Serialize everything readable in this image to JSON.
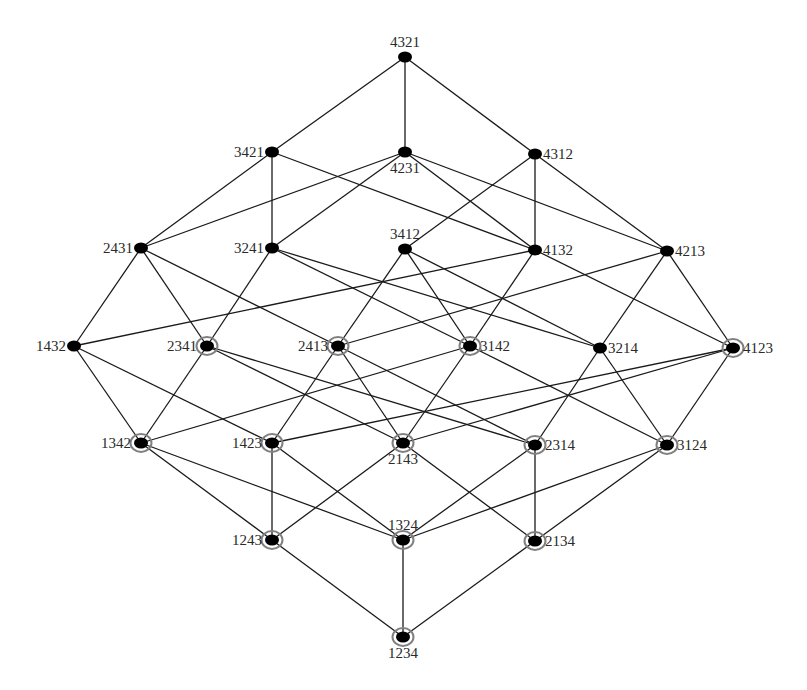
{
  "diagram": {
    "type": "hasse-lattice",
    "colors": {
      "edge": "#1a1a1a",
      "node": "#000000",
      "ring": "#808080",
      "label": "#2a2a2a",
      "background": "#ffffff"
    },
    "nodes": [
      {
        "id": "4321",
        "label": "4321",
        "x": 405,
        "y": 57,
        "ring": false,
        "label_pos": "top"
      },
      {
        "id": "3421",
        "label": "3421",
        "x": 272,
        "y": 152,
        "ring": false,
        "label_pos": "left"
      },
      {
        "id": "4231",
        "label": "4231",
        "x": 405,
        "y": 152,
        "ring": false,
        "label_pos": "bottom"
      },
      {
        "id": "4312",
        "label": "4312",
        "x": 535,
        "y": 154,
        "ring": false,
        "label_pos": "right"
      },
      {
        "id": "2431",
        "label": "2431",
        "x": 141,
        "y": 248,
        "ring": false,
        "label_pos": "left"
      },
      {
        "id": "3241",
        "label": "3241",
        "x": 272,
        "y": 248,
        "ring": false,
        "label_pos": "left"
      },
      {
        "id": "3412",
        "label": "3412",
        "x": 405,
        "y": 249,
        "ring": false,
        "label_pos": "top"
      },
      {
        "id": "4132",
        "label": "4132",
        "x": 535,
        "y": 250,
        "ring": false,
        "label_pos": "right"
      },
      {
        "id": "4213",
        "label": "4213",
        "x": 667,
        "y": 251,
        "ring": false,
        "label_pos": "right"
      },
      {
        "id": "1432",
        "label": "1432",
        "x": 74,
        "y": 346,
        "ring": false,
        "label_pos": "left"
      },
      {
        "id": "2341",
        "label": "2341",
        "x": 207,
        "y": 346,
        "ring": true,
        "label_pos": "left"
      },
      {
        "id": "2413",
        "label": "2413",
        "x": 338,
        "y": 346,
        "ring": true,
        "label_pos": "left"
      },
      {
        "id": "3142",
        "label": "3142",
        "x": 470,
        "y": 346,
        "ring": true,
        "label_pos": "right"
      },
      {
        "id": "3214",
        "label": "3214",
        "x": 600,
        "y": 348,
        "ring": false,
        "label_pos": "right"
      },
      {
        "id": "4123",
        "label": "4123",
        "x": 733,
        "y": 348,
        "ring": true,
        "label_pos": "right"
      },
      {
        "id": "1342",
        "label": "1342",
        "x": 141,
        "y": 443,
        "ring": true,
        "label_pos": "left"
      },
      {
        "id": "1423",
        "label": "1423",
        "x": 272,
        "y": 443,
        "ring": true,
        "label_pos": "left"
      },
      {
        "id": "2143",
        "label": "2143",
        "x": 403,
        "y": 443,
        "ring": true,
        "label_pos": "bottom"
      },
      {
        "id": "2314",
        "label": "2314",
        "x": 535,
        "y": 445,
        "ring": true,
        "label_pos": "right"
      },
      {
        "id": "3124",
        "label": "3124",
        "x": 667,
        "y": 445,
        "ring": true,
        "label_pos": "right"
      },
      {
        "id": "1243",
        "label": "1243",
        "x": 272,
        "y": 540,
        "ring": true,
        "label_pos": "left"
      },
      {
        "id": "1324",
        "label": "1324",
        "x": 403,
        "y": 540,
        "ring": true,
        "label_pos": "top"
      },
      {
        "id": "2134",
        "label": "2134",
        "x": 535,
        "y": 541,
        "ring": true,
        "label_pos": "right"
      },
      {
        "id": "1234",
        "label": "1234",
        "x": 403,
        "y": 637,
        "ring": true,
        "label_pos": "bottom"
      }
    ],
    "edges": [
      [
        "4321",
        "3421"
      ],
      [
        "4321",
        "4231"
      ],
      [
        "4321",
        "4312"
      ],
      [
        "3421",
        "2431"
      ],
      [
        "3421",
        "3241"
      ],
      [
        "3421",
        "4132"
      ],
      [
        "4231",
        "2431"
      ],
      [
        "4231",
        "3241"
      ],
      [
        "4231",
        "4132"
      ],
      [
        "4231",
        "4213"
      ],
      [
        "4312",
        "3412"
      ],
      [
        "4312",
        "4132"
      ],
      [
        "4312",
        "4213"
      ],
      [
        "2431",
        "1432"
      ],
      [
        "2431",
        "2341"
      ],
      [
        "2431",
        "2413"
      ],
      [
        "3241",
        "2341"
      ],
      [
        "3241",
        "3142"
      ],
      [
        "3241",
        "3214"
      ],
      [
        "3412",
        "2413"
      ],
      [
        "3412",
        "3142"
      ],
      [
        "3412",
        "3214"
      ],
      [
        "4132",
        "1432"
      ],
      [
        "4132",
        "3142"
      ],
      [
        "4132",
        "4123"
      ],
      [
        "4213",
        "2413"
      ],
      [
        "4213",
        "3214"
      ],
      [
        "4213",
        "4123"
      ],
      [
        "1432",
        "1342"
      ],
      [
        "1432",
        "1423"
      ],
      [
        "2341",
        "1342"
      ],
      [
        "2341",
        "2314"
      ],
      [
        "2341",
        "2143"
      ],
      [
        "2413",
        "1423"
      ],
      [
        "2413",
        "2143"
      ],
      [
        "2413",
        "2314"
      ],
      [
        "3142",
        "1342"
      ],
      [
        "3142",
        "2143"
      ],
      [
        "3142",
        "3124"
      ],
      [
        "3214",
        "2314"
      ],
      [
        "3214",
        "3124"
      ],
      [
        "4123",
        "1423"
      ],
      [
        "4123",
        "2143"
      ],
      [
        "4123",
        "3124"
      ],
      [
        "1342",
        "1243"
      ],
      [
        "1342",
        "1324"
      ],
      [
        "1423",
        "1243"
      ],
      [
        "1423",
        "1324"
      ],
      [
        "2143",
        "1243"
      ],
      [
        "2143",
        "2134"
      ],
      [
        "2314",
        "1324"
      ],
      [
        "2314",
        "2134"
      ],
      [
        "3124",
        "1324"
      ],
      [
        "3124",
        "2134"
      ],
      [
        "1243",
        "1234"
      ],
      [
        "1324",
        "1234"
      ],
      [
        "2134",
        "1234"
      ]
    ]
  }
}
